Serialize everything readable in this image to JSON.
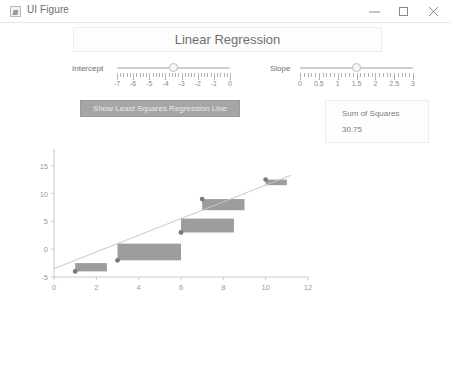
{
  "window": {
    "title": "UI Figure",
    "icon": "matlab-figure-icon",
    "controls": {
      "minimize": "minimize-icon",
      "maximize": "maximize-icon",
      "close": "close-icon"
    }
  },
  "header": {
    "title": "Linear Regression"
  },
  "controls": {
    "intercept": {
      "label": "Intercept",
      "min": -7,
      "max": 0,
      "value": -3.5,
      "ticks": [
        "-7",
        "-6",
        "-5",
        "-4",
        "-3",
        "-2",
        "-1",
        "0"
      ],
      "tick_values": [
        -7,
        -6,
        -5,
        -4,
        -3,
        -2,
        -1,
        0
      ]
    },
    "slope": {
      "label": "Slope",
      "min": 0,
      "max": 3,
      "value": 1.5,
      "ticks": [
        "0",
        "0.5",
        "1",
        "1.5",
        "2",
        "2.5",
        "3"
      ],
      "tick_values": [
        0,
        0.5,
        1,
        1.5,
        2,
        2.5,
        3
      ]
    },
    "show_line_button": "Show Least Squares Regression Line"
  },
  "sum_of_squares": {
    "label": "Sum of Squares",
    "value": "30.75"
  },
  "colors": {
    "square_fill": "#8c8c8c",
    "point": "#7a7a7a",
    "line": "#c9c9c9",
    "axis": "#c9c9c9",
    "button_bg": "#a6a6a6",
    "text": "#6f6f6f"
  },
  "chart_data": {
    "type": "scatter",
    "title": "",
    "xlabel": "",
    "ylabel": "",
    "xlim": [
      0,
      12
    ],
    "ylim": [
      -5,
      18
    ],
    "xticks": [
      0,
      2,
      4,
      6,
      8,
      10,
      12
    ],
    "yticks": [
      -5,
      0,
      5,
      10,
      15
    ],
    "grid": false,
    "legend": false,
    "points": [
      {
        "x": 1,
        "y": -4
      },
      {
        "x": 3,
        "y": -2
      },
      {
        "x": 6,
        "y": 3
      },
      {
        "x": 7,
        "y": 9
      },
      {
        "x": 10,
        "y": 12.5
      }
    ],
    "fit_line": {
      "intercept": -3.5,
      "slope": 1.5,
      "x_start": 0,
      "x_end": 11.2
    },
    "residual_squares": [
      {
        "x": 1,
        "y": -4,
        "residual": 1.5
      },
      {
        "x": 3,
        "y": -2,
        "residual": 3
      },
      {
        "x": 6,
        "y": 3,
        "residual": 2.5
      },
      {
        "x": 7,
        "y": 9,
        "residual": -2
      },
      {
        "x": 10,
        "y": 12.5,
        "residual": -1
      }
    ]
  }
}
